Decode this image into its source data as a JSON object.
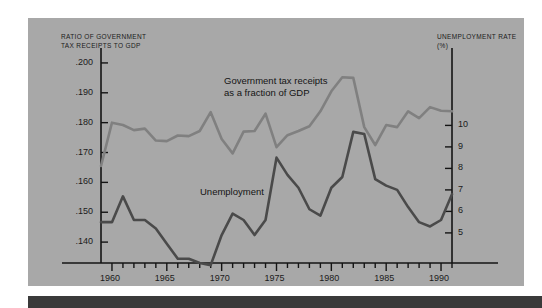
{
  "figure": {
    "background_color": "#a8a8a8",
    "page_color": "#ffffff",
    "footer_bar_color": "#3a3a3a"
  },
  "axis_titles": {
    "left": "RATIO OF GOVERNMENT\nTAX RECEIPTS TO GDP",
    "right": "UNEMPLOYMENT RATE (%)"
  },
  "annotations": {
    "tax": "Government tax receipts\nas a fraction of GDP",
    "unemployment": "Unemployment"
  },
  "chart_data": {
    "type": "line",
    "title": "",
    "xlabel": "",
    "ylabel": "RATIO OF GOVERNMENT TAX RECEIPTS TO GDP",
    "y2label": "UNEMPLOYMENT RATE (%)",
    "grid": false,
    "legend": "inline-annotations",
    "xlim": [
      1959,
      1991
    ],
    "xticks_major": [
      1960,
      1965,
      1970,
      1975,
      1980,
      1985,
      1990
    ],
    "xticks_minor_step": 1,
    "ylim_left": [
      0.133,
      0.205
    ],
    "yticks_left": [
      0.2,
      0.19,
      0.18,
      0.17,
      0.16,
      0.15,
      0.14
    ],
    "yticklabels_left": [
      ".200",
      ".190",
      ".180",
      ".170",
      ".160",
      ".150",
      ".140"
    ],
    "ylim_right": [
      3.6,
      13.6
    ],
    "yticks_right": [
      10,
      9,
      8,
      7,
      6,
      5
    ],
    "yticklabels_right": [
      "10",
      "9",
      "8",
      "7",
      "6",
      "5"
    ],
    "series": [
      {
        "name": "Government tax receipts as a fraction of GDP",
        "axis": "left",
        "color": "#808080",
        "x": [
          1959,
          1960,
          1961,
          1962,
          1963,
          1964,
          1965,
          1966,
          1967,
          1968,
          1969,
          1970,
          1971,
          1972,
          1973,
          1974,
          1975,
          1976,
          1977,
          1978,
          1979,
          1980,
          1981,
          1982,
          1983,
          1984,
          1985,
          1986,
          1987,
          1988,
          1989,
          1990,
          1991
        ],
        "values": [
          0.1655,
          0.18,
          0.1792,
          0.1775,
          0.178,
          0.174,
          0.1738,
          0.1757,
          0.1755,
          0.1772,
          0.1835,
          0.1745,
          0.1697,
          0.177,
          0.1772,
          0.183,
          0.1718,
          0.1758,
          0.1772,
          0.1788,
          0.1838,
          0.1905,
          0.1952,
          0.195,
          0.1785,
          0.1725,
          0.1792,
          0.1785,
          0.1838,
          0.1815,
          0.1852,
          0.184,
          0.1838
        ]
      },
      {
        "name": "Unemployment",
        "axis": "right",
        "color": "#4a4a4a",
        "x": [
          1959,
          1960,
          1961,
          1962,
          1963,
          1964,
          1965,
          1966,
          1967,
          1968,
          1969,
          1970,
          1971,
          1972,
          1973,
          1974,
          1975,
          1976,
          1977,
          1978,
          1979,
          1980,
          1981,
          1982,
          1983,
          1984,
          1985,
          1986,
          1987,
          1988,
          1989,
          1990,
          1991
        ],
        "values": [
          5.5,
          5.5,
          6.7,
          5.6,
          5.6,
          5.2,
          4.5,
          3.8,
          3.8,
          3.6,
          3.5,
          4.9,
          5.9,
          5.6,
          4.9,
          5.6,
          8.5,
          7.7,
          7.1,
          6.1,
          5.8,
          7.1,
          7.6,
          9.7,
          9.6,
          7.5,
          7.2,
          7.0,
          6.2,
          5.5,
          5.3,
          5.6,
          6.8
        ]
      }
    ]
  }
}
